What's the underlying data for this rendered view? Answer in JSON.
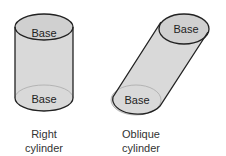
{
  "right_cylinder": {
    "top_label": "Base",
    "bottom_label": "Base",
    "caption_line1": "Right",
    "caption_line2": "cylinder"
  },
  "oblique_cylinder": {
    "top_label": "Base",
    "bottom_label": "Base",
    "caption_line1": "Oblique",
    "caption_line2": "cylinder"
  },
  "colors": {
    "fill": "#d6d6d6",
    "stroke": "#222222",
    "inner_edge": "#9a9a9a"
  }
}
